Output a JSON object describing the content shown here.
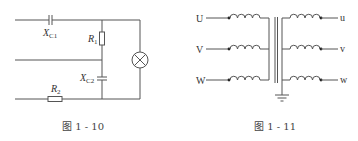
{
  "figures": [
    {
      "id": "fig-1-10",
      "caption": "图 1 - 10",
      "components": {
        "xc1": {
          "main": "X",
          "sub": "C1"
        },
        "r1": {
          "main": "R",
          "sub": "1"
        },
        "xc2": {
          "main": "X",
          "sub": "C2"
        },
        "r2": {
          "main": "R",
          "sub": "2"
        },
        "lamp": "lamp"
      }
    },
    {
      "id": "fig-1-11",
      "caption": "图 1 - 11",
      "primary_labels": [
        "U",
        "V",
        "W"
      ],
      "secondary_labels": [
        "u",
        "v",
        "w"
      ]
    }
  ]
}
